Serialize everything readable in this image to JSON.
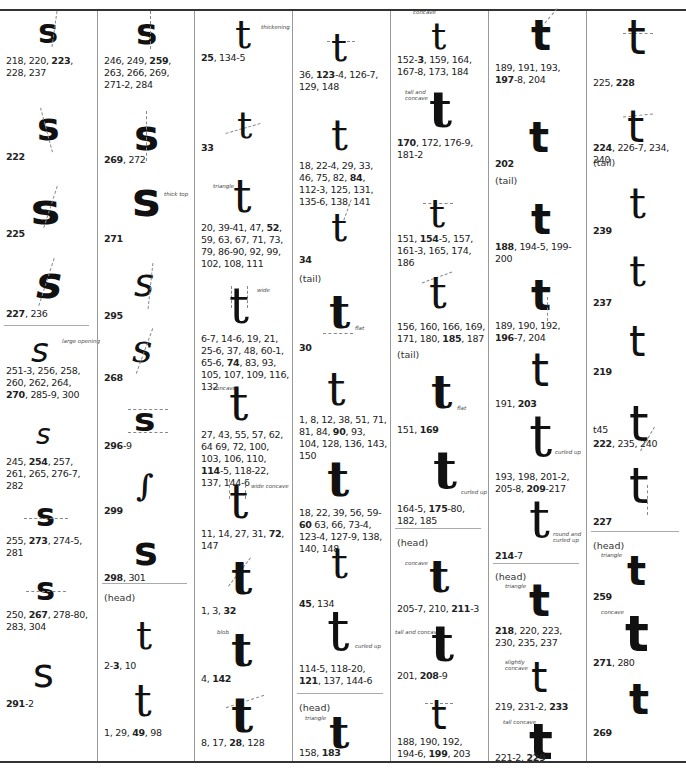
{
  "columns": [
    {
      "id": "c1",
      "entries": [
        {
          "glyph": "s",
          "refs": [
            {
              "t": "218, 220, "
            },
            {
              "t": "223",
              "b": true
            },
            {
              "t": ", 228, 237"
            }
          ]
        },
        {
          "glyph": "s",
          "refs": [
            {
              "t": "222",
              "b": true
            }
          ]
        },
        {
          "glyph": "s",
          "refs": [
            {
              "t": "225",
              "b": true
            }
          ]
        },
        {
          "glyph": "s",
          "refs": [
            {
              "t": "227",
              "b": true
            },
            {
              "t": ", 236"
            }
          ]
        },
        {
          "glyph": "s",
          "note": "large opening",
          "refs": [
            {
              "t": "251-3, 256, 258, 260, 262, 264, "
            },
            {
              "t": "270",
              "b": true
            },
            {
              "t": ", 285-9, 300"
            }
          ]
        },
        {
          "glyph": "s",
          "refs": [
            {
              "t": "245, "
            },
            {
              "t": "254",
              "b": true
            },
            {
              "t": ", 257, 261, 265, 276-7, 282"
            }
          ]
        },
        {
          "glyph": "s",
          "refs": [
            {
              "t": "255, "
            },
            {
              "t": "273",
              "b": true
            },
            {
              "t": ", 274-5, 281"
            }
          ]
        },
        {
          "glyph": "s",
          "refs": [
            {
              "t": "250, "
            },
            {
              "t": "267",
              "b": true
            },
            {
              "t": ", 278-80, 283, 304"
            }
          ]
        },
        {
          "glyph": "s",
          "refs": [
            {
              "t": "291",
              "b": true
            },
            {
              "t": "-2"
            }
          ]
        }
      ]
    },
    {
      "id": "c2",
      "entries": [
        {
          "glyph": "s",
          "refs": [
            {
              "t": "246, 249, "
            },
            {
              "t": "259",
              "b": true
            },
            {
              "t": ", 263, 266, 269, 271-2, 284"
            }
          ]
        },
        {
          "glyph": "s",
          "refs": [
            {
              "t": "269",
              "b": true
            },
            {
              "t": ", 272"
            }
          ]
        },
        {
          "glyph": "s",
          "note": "thick top",
          "refs": [
            {
              "t": "271",
              "b": true
            }
          ]
        },
        {
          "glyph": "s",
          "refs": [
            {
              "t": "295",
              "b": true
            }
          ]
        },
        {
          "glyph": "s",
          "refs": [
            {
              "t": "268",
              "b": true
            }
          ]
        },
        {
          "glyph": "s",
          "refs": [
            {
              "t": "296",
              "b": true
            },
            {
              "t": "-9"
            }
          ]
        },
        {
          "glyph": "s",
          "refs": [
            {
              "t": "299",
              "b": true
            }
          ]
        },
        {
          "glyph": "s",
          "refs": [
            {
              "t": "298",
              "b": true
            },
            {
              "t": ", 301"
            }
          ]
        },
        {
          "section": "(head)"
        },
        {
          "glyph": "t",
          "refs": [
            {
              "t": "2-"
            },
            {
              "t": "3",
              "b": true
            },
            {
              "t": ", 10"
            }
          ]
        },
        {
          "glyph": "t",
          "refs": [
            {
              "t": "1, 29, "
            },
            {
              "t": "49",
              "b": true
            },
            {
              "t": ", 98"
            }
          ]
        }
      ]
    },
    {
      "id": "c3",
      "entries": [
        {
          "glyph": "t",
          "note": "thickening",
          "refs": [
            {
              "t": "25",
              "b": true
            },
            {
              "t": ", 134-5"
            }
          ]
        },
        {
          "glyph": "t",
          "refs": [
            {
              "t": "33",
              "b": true
            }
          ]
        },
        {
          "glyph": "t",
          "note": "triangle",
          "refs": [
            {
              "t": "20, 39-41, 47, "
            },
            {
              "t": "52",
              "b": true
            },
            {
              "t": ", 59, 63, 67, 71, 73, 79, 86-90, 92, 99, 102, 108, 111"
            }
          ]
        },
        {
          "glyph": "t",
          "note": "wide",
          "refs": [
            {
              "t": "6-7, 14-6, 19, 21, 25-6, 37, 48, 60-1, 65-6, "
            },
            {
              "t": "74",
              "b": true
            },
            {
              "t": ", 83, 93, 105, 107, 109, 116, 132"
            }
          ]
        },
        {
          "glyph": "t",
          "note": "concave",
          "refs": [
            {
              "t": "27, 43, 55, 57, 62, 64 69, 72, 100, 103, 106, 110, "
            },
            {
              "t": "114",
              "b": true
            },
            {
              "t": "-5, 118-22, 137, 144-6"
            }
          ]
        },
        {
          "glyph": "t",
          "note": "wide concave",
          "refs": [
            {
              "t": "11, 14, 27, 31, "
            },
            {
              "t": "72",
              "b": true
            },
            {
              "t": ", 147"
            }
          ]
        },
        {
          "glyph": "t",
          "refs": [
            {
              "t": "1, 3, "
            },
            {
              "t": "32",
              "b": true
            }
          ]
        },
        {
          "glyph": "t",
          "note": "blob",
          "refs": [
            {
              "t": "4, "
            },
            {
              "t": "142",
              "b": true
            }
          ]
        },
        {
          "glyph": "t",
          "refs": [
            {
              "t": "8, 17, "
            },
            {
              "t": "28",
              "b": true
            },
            {
              "t": ", 128"
            }
          ]
        }
      ]
    },
    {
      "id": "c4",
      "entries": [
        {
          "glyph": "t",
          "refs": [
            {
              "t": "36, "
            },
            {
              "t": "123",
              "b": true
            },
            {
              "t": "-4, 126-7, 129, 148"
            }
          ]
        },
        {
          "glyph": "t",
          "refs": [
            {
              "t": "18, 22-4, 29, 33, 46, 75, 82, "
            },
            {
              "t": "84",
              "b": true
            },
            {
              "t": ", 112-3, 125, 131, 135-6, 138, 141"
            }
          ]
        },
        {
          "glyph": "t",
          "refs": [
            {
              "t": "34",
              "b": true
            }
          ]
        },
        {
          "section": "(tail)"
        },
        {
          "glyph": "t",
          "note": "flat",
          "refs": [
            {
              "t": "30",
              "b": true
            }
          ]
        },
        {
          "glyph": "t",
          "refs": [
            {
              "t": "1, 8, 12, 38, 51, 71, 81, 84, "
            },
            {
              "t": "90",
              "b": true
            },
            {
              "t": ", 93, 104, 128, 136, 143, 150"
            }
          ]
        },
        {
          "glyph": "t",
          "refs": [
            {
              "t": "18, 22, 39, 56, 59-"
            },
            {
              "t": "60",
              "b": true
            },
            {
              "t": " 63, 66, 73-4, 123-4, 127-9, 138, 140, 148"
            }
          ]
        },
        {
          "glyph": "t",
          "refs": [
            {
              "t": "45",
              "b": true
            },
            {
              "t": ", 134"
            }
          ]
        },
        {
          "glyph": "t",
          "note": "curled up",
          "refs": [
            {
              "t": "114-5, 118-20, "
            },
            {
              "t": "121",
              "b": true
            },
            {
              "t": ", 137, 144-6"
            }
          ]
        },
        {
          "section": "(head)"
        },
        {
          "glyph": "t",
          "note": "triangle",
          "refs": [
            {
              "t": "158, "
            },
            {
              "t": "183",
              "b": true
            }
          ]
        }
      ]
    },
    {
      "id": "c5",
      "entries": [
        {
          "glyph": "t",
          "note": "concave",
          "refs": [
            {
              "t": "152-"
            },
            {
              "t": "3",
              "b": true
            },
            {
              "t": ", 159, 164, 167-8, 173, 184"
            }
          ]
        },
        {
          "glyph": "t",
          "note": "tall and concave",
          "refs": [
            {
              "t": "170",
              "b": true
            },
            {
              "t": ", 172, 176-9, 181-2"
            }
          ]
        },
        {
          "glyph": "t",
          "refs": [
            {
              "t": "151, "
            },
            {
              "t": "154",
              "b": true
            },
            {
              "t": "-5, 157, 161-3, 165, 174, 186"
            }
          ]
        },
        {
          "glyph": "t",
          "refs": [
            {
              "t": "156, 160, 166, 169, 171, 180, "
            },
            {
              "t": "185",
              "b": true
            },
            {
              "t": ", 187"
            }
          ]
        },
        {
          "section": "(tail)"
        },
        {
          "glyph": "t",
          "note": "flat",
          "refs": [
            {
              "t": "151, "
            },
            {
              "t": "169",
              "b": true
            }
          ]
        },
        {
          "glyph": "t",
          "note": "curled up",
          "refs": [
            {
              "t": "164-5, "
            },
            {
              "t": "175",
              "b": true
            },
            {
              "t": "-80, 182, 185"
            }
          ]
        },
        {
          "section": "(head)"
        },
        {
          "glyph": "t",
          "note": "concave",
          "refs": [
            {
              "t": "205-7, 210, "
            },
            {
              "t": "211",
              "b": true
            },
            {
              "t": "-3"
            }
          ]
        },
        {
          "glyph": "t",
          "note": "tall and concave",
          "refs": [
            {
              "t": "201, "
            },
            {
              "t": "208",
              "b": true
            },
            {
              "t": "-9"
            }
          ]
        },
        {
          "glyph": "t",
          "refs": [
            {
              "t": "188, 190, 192, 194-6, "
            },
            {
              "t": "199",
              "b": true
            },
            {
              "t": ", 203"
            }
          ]
        }
      ]
    },
    {
      "id": "c6",
      "entries": [
        {
          "glyph": "t",
          "refs": [
            {
              "t": "189, 191, 193, "
            },
            {
              "t": "197",
              "b": true
            },
            {
              "t": "-8, 204"
            }
          ]
        },
        {
          "glyph": "t",
          "refs": [
            {
              "t": "202",
              "b": true
            }
          ]
        },
        {
          "section": "(tail)"
        },
        {
          "glyph": "t",
          "refs": [
            {
              "t": "188",
              "b": true
            },
            {
              "t": ", 194-5, 199-200"
            }
          ]
        },
        {
          "glyph": "t",
          "refs": [
            {
              "t": "189, 190, 192, "
            },
            {
              "t": "196",
              "b": true
            },
            {
              "t": "-7, 204"
            }
          ]
        },
        {
          "glyph": "t",
          "refs": [
            {
              "t": "191, "
            },
            {
              "t": "203",
              "b": true
            }
          ]
        },
        {
          "glyph": "t",
          "note": "curled up",
          "refs": [
            {
              "t": "193, 198, 201-2, 205-8, "
            },
            {
              "t": "209",
              "b": true
            },
            {
              "t": "-217"
            }
          ]
        },
        {
          "glyph": "t",
          "note": "round and curled up",
          "refs": [
            {
              "t": "214",
              "b": true
            },
            {
              "t": "-7"
            }
          ]
        },
        {
          "section": "(head)"
        },
        {
          "glyph": "t",
          "note": "triangle",
          "refs": [
            {
              "t": "218",
              "b": true
            },
            {
              "t": ", 220, 223, 230, 235, 237"
            }
          ]
        },
        {
          "glyph": "t",
          "note": "slightly concave",
          "refs": [
            {
              "t": "219, 231-2, "
            },
            {
              "t": "233",
              "b": true
            }
          ]
        },
        {
          "glyph": "t",
          "note": "tall concave",
          "refs": [
            {
              "t": "221-2, "
            },
            {
              "t": "229",
              "b": true
            }
          ]
        }
      ]
    },
    {
      "id": "c7",
      "entries": [
        {
          "glyph": "t",
          "refs": [
            {
              "t": "225, "
            },
            {
              "t": "228",
              "b": true
            }
          ]
        },
        {
          "glyph": "t",
          "refs": [
            {
              "t": "224",
              "b": true
            },
            {
              "t": ", 226-7, 234, 240"
            }
          ]
        },
        {
          "section": "(tail)"
        },
        {
          "glyph": "t",
          "refs": [
            {
              "t": "239",
              "b": true
            }
          ]
        },
        {
          "glyph": "t",
          "refs": [
            {
              "t": "237",
              "b": true
            }
          ]
        },
        {
          "glyph": "t",
          "refs": [
            {
              "t": "219",
              "b": true
            }
          ]
        },
        {
          "glyph": "t",
          "pre": "t45",
          "refs": [
            {
              "t": "222",
              "b": true
            },
            {
              "t": ", 235, 240"
            }
          ]
        },
        {
          "glyph": "t",
          "refs": [
            {
              "t": "227",
              "b": true
            }
          ]
        },
        {
          "section": "(head)"
        },
        {
          "glyph": "t",
          "note": "triangle",
          "refs": [
            {
              "t": "259",
              "b": true
            }
          ]
        },
        {
          "glyph": "t",
          "note": "concave",
          "refs": [
            {
              "t": "271",
              "b": true
            },
            {
              "t": ", 280"
            }
          ]
        },
        {
          "glyph": "t",
          "refs": [
            {
              "t": "269",
              "b": true
            }
          ]
        }
      ]
    }
  ]
}
